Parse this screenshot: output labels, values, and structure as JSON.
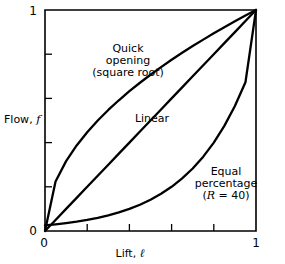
{
  "chart_data": {
    "type": "line",
    "title": "",
    "xlabel": "Lift",
    "xlabel_var": "ℓ",
    "xlabel_full": "Lift, ℓ",
    "ylabel": "Flow",
    "ylabel_var": "f",
    "ylabel_full": "Flow, f",
    "xlim": [
      0,
      1
    ],
    "ylim": [
      0,
      1
    ],
    "grid": false,
    "legend": "inline-annotations",
    "x_tick_labels": [
      "0",
      "1"
    ],
    "y_tick_labels": [
      "0",
      "1"
    ],
    "x_tick_positions": [
      0,
      0.2,
      0.4,
      0.6,
      0.8,
      1
    ],
    "y_tick_positions": [
      0,
      0.2,
      0.4,
      0.6,
      0.8,
      1
    ],
    "x_labeled_ticks": [
      0,
      1
    ],
    "y_labeled_ticks": [
      0,
      1
    ],
    "axis_color": "#000000",
    "curve_color": "#000000",
    "background": "#ffffff",
    "x": [
      0,
      0.05,
      0.1,
      0.15,
      0.2,
      0.25,
      0.3,
      0.35,
      0.4,
      0.45,
      0.5,
      0.55,
      0.6,
      0.65,
      0.7,
      0.75,
      0.8,
      0.85,
      0.9,
      0.95,
      1
    ],
    "series": [
      {
        "name": "Quick opening (square root)",
        "label_lines": [
          "Quick",
          "opening",
          "(square root)"
        ],
        "equation": "f = sqrt(l)",
        "values": [
          0,
          0.2236,
          0.3162,
          0.3873,
          0.4472,
          0.5,
          0.5477,
          0.5916,
          0.6325,
          0.6708,
          0.7071,
          0.7416,
          0.7746,
          0.8062,
          0.8367,
          0.866,
          0.8944,
          0.9219,
          0.9487,
          0.9747,
          1
        ]
      },
      {
        "name": "Linear",
        "label_lines": [
          "Linear"
        ],
        "equation": "f = l",
        "values": [
          0,
          0.05,
          0.1,
          0.15,
          0.2,
          0.25,
          0.3,
          0.35,
          0.4,
          0.45,
          0.5,
          0.55,
          0.6,
          0.65,
          0.7,
          0.75,
          0.8,
          0.85,
          0.9,
          0.95,
          1
        ]
      },
      {
        "name": "Equal percentage (R = 40)",
        "label_lines": [
          "Equal",
          "percentage",
          "(R = 40)"
        ],
        "label_var": "R",
        "label_tail": " = 40)",
        "label_head": "(",
        "equation": "f = R^(l-1), R = 40",
        "R": 40,
        "values": [
          0.025,
          0.0297,
          0.0354,
          0.0421,
          0.05,
          0.0595,
          0.0707,
          0.0841,
          0.1,
          0.1189,
          0.1414,
          0.1682,
          0.2,
          0.2378,
          0.2828,
          0.3364,
          0.4,
          0.4757,
          0.5657,
          0.6727,
          1
        ]
      }
    ],
    "annotations": [
      {
        "text": "Quick opening (square root)",
        "x": 0.28,
        "y": 0.82
      },
      {
        "text": "Linear",
        "x": 0.42,
        "y": 0.53
      },
      {
        "text": "Equal percentage (R = 40)",
        "x": 0.78,
        "y": 0.27
      }
    ]
  }
}
